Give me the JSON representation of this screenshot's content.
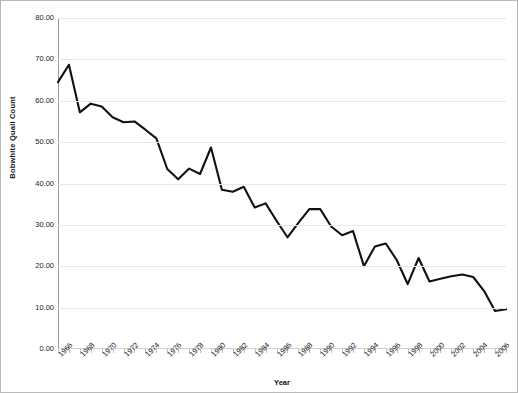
{
  "chart_data": {
    "type": "line",
    "title": "",
    "xlabel": "Year",
    "ylabel": "Bobwhite Quail Count",
    "xlim": [
      1966,
      2007
    ],
    "ylim": [
      0,
      80
    ],
    "grid": true,
    "legend": false,
    "y_ticks": [
      "0.00",
      "10.00",
      "20.00",
      "30.00",
      "40.00",
      "50.00",
      "60.00",
      "70.00",
      "80.00"
    ],
    "y_tick_values": [
      0,
      10,
      20,
      30,
      40,
      50,
      60,
      70,
      80
    ],
    "x_tick_labels": [
      "1966",
      "1968",
      "1970",
      "1972",
      "1974",
      "1976",
      "1978",
      "1980",
      "1982",
      "1984",
      "1986",
      "1988",
      "1990",
      "1992",
      "1994",
      "1996",
      "1998",
      "2000",
      "2002",
      "2004",
      "2006"
    ],
    "x": [
      1966,
      1967,
      1968,
      1969,
      1970,
      1971,
      1972,
      1973,
      1974,
      1975,
      1976,
      1977,
      1978,
      1979,
      1980,
      1981,
      1982,
      1983,
      1984,
      1985,
      1986,
      1987,
      1988,
      1989,
      1990,
      1991,
      1992,
      1993,
      1994,
      1995,
      1996,
      1997,
      1998,
      1999,
      2000,
      2001,
      2002,
      2003,
      2004,
      2005,
      2006,
      2007
    ],
    "values": [
      64.5,
      68.7,
      57.2,
      59.3,
      58.6,
      56.0,
      54.8,
      55.0,
      53.0,
      50.9,
      43.5,
      41.0,
      43.6,
      42.3,
      48.7,
      38.5,
      38.0,
      39.2,
      34.2,
      35.2,
      31.0,
      27.0,
      30.5,
      33.8,
      33.8,
      29.6,
      27.5,
      28.5,
      20.0,
      24.8,
      25.5,
      21.5,
      15.7,
      22.0,
      16.3,
      17.0,
      17.6,
      18.0,
      17.4,
      14.0,
      9.2,
      9.6
    ],
    "line_color": "#111111",
    "line_width": 2.1,
    "background_color": "#ffffff",
    "gridline_color": "#e6e6e6",
    "border_color": "#b9b9b9"
  }
}
